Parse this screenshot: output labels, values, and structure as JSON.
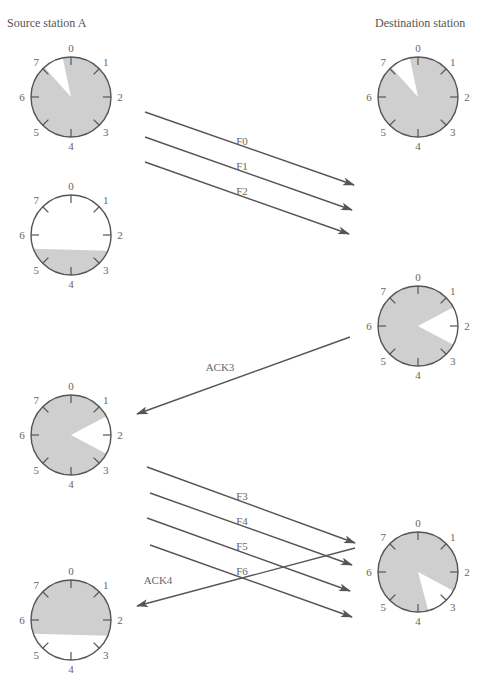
{
  "header": {
    "source_title": "Source station A",
    "destination_title": "Destination station"
  },
  "colors": {
    "shade": "#cfcfcf",
    "line": "#555555",
    "text": "#666666"
  },
  "clock_labels": [
    "0",
    "1",
    "2",
    "3",
    "4",
    "5",
    "6",
    "7"
  ],
  "clocks": [
    {
      "id": "source-1",
      "side": "source",
      "cx": 71,
      "cy": 97,
      "r": 40,
      "white_from_deg": 318,
      "white_to_deg": 348
    },
    {
      "id": "source-2",
      "side": "source",
      "cx": 71,
      "cy": 235,
      "r": 40,
      "white_from_deg": 250,
      "white_to_deg": 113
    },
    {
      "id": "source-3",
      "side": "source",
      "cx": 71,
      "cy": 435,
      "r": 40,
      "white_from_deg": 62,
      "white_to_deg": 118
    },
    {
      "id": "source-4",
      "side": "source",
      "cx": 71,
      "cy": 620,
      "r": 40,
      "white_from_deg": 113,
      "white_to_deg": 250
    },
    {
      "id": "dest-1",
      "side": "destination",
      "cx": 418,
      "cy": 97,
      "r": 40,
      "white_from_deg": 318,
      "white_to_deg": 348
    },
    {
      "id": "dest-2",
      "side": "destination",
      "cx": 418,
      "cy": 326,
      "r": 40,
      "white_from_deg": 62,
      "white_to_deg": 118
    },
    {
      "id": "dest-3",
      "side": "destination",
      "cx": 418,
      "cy": 572,
      "r": 40,
      "white_from_deg": 118,
      "white_to_deg": 165
    }
  ],
  "arrows": [
    {
      "label": "F0",
      "x1": 145,
      "y1": 112,
      "x2": 354,
      "y2": 185,
      "lx": 242,
      "ly": 145
    },
    {
      "label": "F1",
      "x1": 145,
      "y1": 137,
      "x2": 352,
      "y2": 210,
      "lx": 242,
      "ly": 170
    },
    {
      "label": "F2",
      "x1": 145,
      "y1": 162,
      "x2": 349,
      "y2": 234,
      "lx": 242,
      "ly": 195
    },
    {
      "label": "ACK3",
      "x1": 350,
      "y1": 337,
      "x2": 137,
      "y2": 414,
      "lx": 220,
      "ly": 371
    },
    {
      "label": "F3",
      "x1": 147,
      "y1": 467,
      "x2": 355,
      "y2": 543,
      "lx": 242,
      "ly": 500
    },
    {
      "label": "F4",
      "x1": 150,
      "y1": 493,
      "x2": 352,
      "y2": 565,
      "lx": 242,
      "ly": 525
    },
    {
      "label": "F5",
      "x1": 147,
      "y1": 518,
      "x2": 350,
      "y2": 591,
      "lx": 242,
      "ly": 550
    },
    {
      "label": "F6",
      "x1": 150,
      "y1": 545,
      "x2": 352,
      "y2": 617,
      "lx": 242,
      "ly": 575
    },
    {
      "label": "ACK4",
      "x1": 355,
      "y1": 548,
      "x2": 137,
      "y2": 606,
      "lx": 158,
      "ly": 584
    }
  ]
}
